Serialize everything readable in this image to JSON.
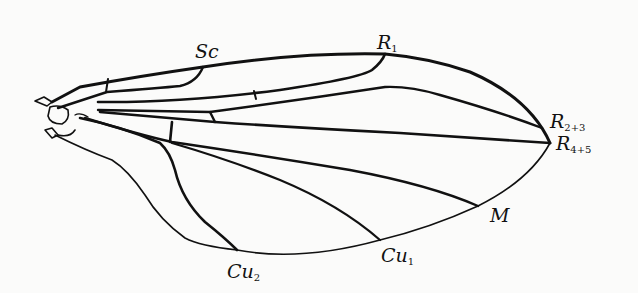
{
  "figure": {
    "background_color": "#fbfbfa",
    "stroke_color": "#111111"
  },
  "labels": {
    "sc": {
      "main": "Sc",
      "sub": ""
    },
    "r1": {
      "main": "R",
      "sub": "1"
    },
    "r23": {
      "main": "R",
      "sub": "2+3"
    },
    "r45": {
      "main": "R",
      "sub": "4+5"
    },
    "m": {
      "main": "M",
      "sub": ""
    },
    "cu1": {
      "main": "Cu",
      "sub": "1"
    },
    "cu2": {
      "main": "Cu",
      "sub": "2"
    }
  }
}
